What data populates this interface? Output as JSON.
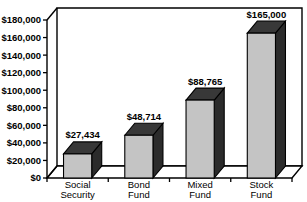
{
  "chart_data": {
    "type": "bar",
    "title": "",
    "subtitle": "",
    "xlabel": "",
    "ylabel": "",
    "categories": [
      "Social Security",
      "Bond Fund",
      "Mixed Fund",
      "Stock Fund"
    ],
    "category_lines": [
      [
        "Social",
        "Security"
      ],
      [
        "Bond",
        "Fund"
      ],
      [
        "Mixed",
        "Fund"
      ],
      [
        "Stock",
        "Fund"
      ]
    ],
    "values": [
      27434,
      48714,
      88765,
      165000
    ],
    "data_labels": [
      "$27,434",
      "$48,714",
      "$88,765",
      "$165,000"
    ],
    "ylim": [
      0,
      180000
    ],
    "ytick_step": 20000,
    "ytick_values": [
      0,
      20000,
      40000,
      60000,
      80000,
      100000,
      120000,
      140000,
      160000,
      180000
    ],
    "ytick_labels": [
      "$0",
      "$20,000",
      "$40,000",
      "$60,000",
      "$80,000",
      "$100,000",
      "$120,000",
      "$140,000",
      "$160,000",
      "$180,000"
    ],
    "grid": false,
    "legend": false,
    "legend_position": "none",
    "style": "3d-bar",
    "colors": {
      "bar_front": "#c4c4c4",
      "bar_top": "#383838",
      "bar_side": "#2b2b2b",
      "outline": "#000000",
      "plot_background": "#ffffff",
      "floor": "#ffffff",
      "text": "#000000"
    },
    "annotations": []
  }
}
